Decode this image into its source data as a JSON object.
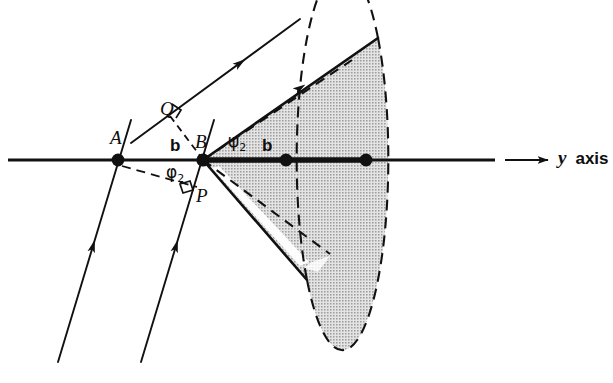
{
  "figure": {
    "domain_kind": "geometric-optics-scattering-diagram",
    "background_color": "#ffffff",
    "ink_color": "#111111",
    "cone_fill_color": "#c9c9c9",
    "labels": {
      "point_a": "A",
      "point_b": "B",
      "point_p": "P",
      "point_q": "Q",
      "impact_parameter_left": "b",
      "impact_parameter_right": "b",
      "angle_phi": "φ",
      "angle_phi_sub": "2",
      "angle_psi": "ψ",
      "angle_psi_sub": "2",
      "axis_label_symbol": "y",
      "axis_label_word": "axis"
    },
    "geometry": {
      "axis": {
        "y": 160,
        "x_start": 8,
        "x_end": 495,
        "arrow_tail_x": 505,
        "arrow_head_x": 548,
        "thick_segment_x_start": 203,
        "thick_segment_x_end": 370
      },
      "points": [
        {
          "name": "A",
          "x": 118,
          "y": 160,
          "r": 6.2
        },
        {
          "name": "B",
          "x": 203,
          "y": 160,
          "r": 6.2
        },
        {
          "name": "axis-dot-1",
          "x": 286,
          "y": 160,
          "r": 6.2
        },
        {
          "name": "axis-dot-2",
          "x": 366,
          "y": 160,
          "r": 6.2
        }
      ],
      "incoming_rays": [
        {
          "name": "ray-left",
          "x1": 58,
          "y1": 362,
          "x2": 131,
          "y2": 120,
          "arrow_t": 0.52
        },
        {
          "name": "ray-right",
          "x1": 141,
          "y1": 362,
          "x2": 214,
          "y2": 120,
          "arrow_t": 0.52
        }
      ],
      "outgoing_ray": {
        "x1": 131,
        "y1": 143,
        "x2": 298,
        "y2": 20,
        "arrow_t": 0.62
      },
      "cone": {
        "apex_x": 203,
        "apex_y": 160,
        "top_rim_x": 378,
        "top_rim_y": 38,
        "bottom_rim_x": 307,
        "bottom_rim_y": 280,
        "rim_center_x": 352,
        "rim_center_y": 159,
        "rim_rx": 29,
        "rim_ry": 121
      },
      "dashed_chord": {
        "x1": 124,
        "y1": 166,
        "x2": 196,
        "y2": 186
      },
      "dashed_qb": {
        "x1": 167,
        "y1": 113,
        "x2": 203,
        "y2": 160
      },
      "perpendicular_marks": [
        {
          "name": "right-angle-at-q",
          "x": 178,
          "y": 112
        },
        {
          "name": "right-angle-at-p",
          "x": 186,
          "y": 188
        }
      ]
    }
  }
}
